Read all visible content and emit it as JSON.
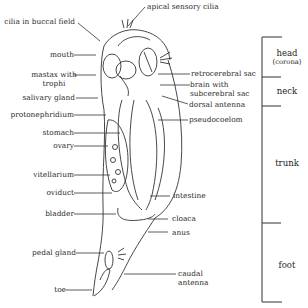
{
  "diagram": {
    "labels_left": {
      "cilia_buccal": "cilia in buccal field",
      "mouth": "mouth",
      "mastax_1": "mastax with",
      "mastax_2": "trophi",
      "salivary": "salivary gland",
      "protonephridium": "protonephridium",
      "stomach": "stomach",
      "ovary": "ovary",
      "vitellarium": "vitellarium",
      "oviduct": "oviduct",
      "bladder": "bladder",
      "pedal_gland": "pedal gland",
      "toe": "toe"
    },
    "labels_right": {
      "apical": "apical sensory cilia",
      "retrocerebral": "retrocerebral sac",
      "brain_1": "brain with",
      "brain_2": "subcerebral sac",
      "dorsal_antenna": "dorsal antenna",
      "pseudocoelom": "pseudocoelom",
      "intestine": "intestine",
      "cloaca": "cloaca",
      "anus": "anus",
      "caudal_1": "caudal",
      "caudal_2": "antenna"
    },
    "regions": {
      "head": "head",
      "head_sub": "(corona)",
      "neck": "neck",
      "trunk": "trunk",
      "foot": "foot"
    },
    "colors": {
      "line": "#333333",
      "text": "#2a2a2a",
      "background": "#ffffff"
    }
  }
}
